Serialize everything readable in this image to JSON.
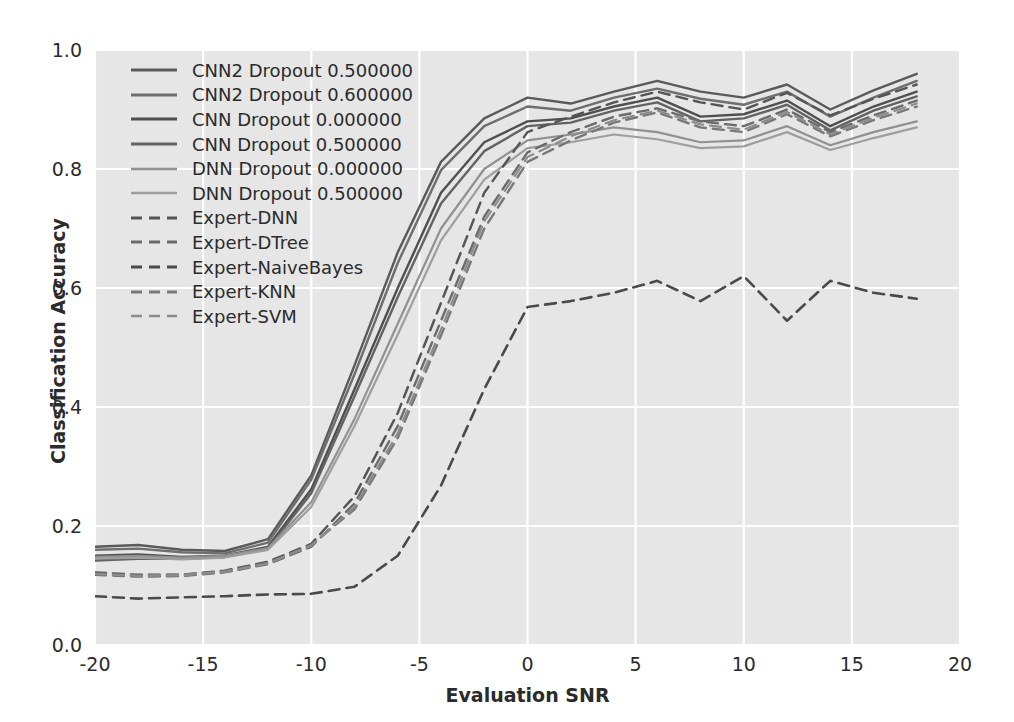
{
  "chart_data": {
    "type": "line",
    "title": "",
    "xlabel": "Evaluation SNR",
    "ylabel": "Classification Accuracy",
    "xlim": [
      -20,
      20
    ],
    "ylim": [
      0.0,
      1.0
    ],
    "xticks": [
      "-20",
      "-15",
      "-10",
      "-5",
      "0",
      "5",
      "10",
      "15",
      "20"
    ],
    "xtick_values": [
      -20,
      -15,
      -10,
      -5,
      0,
      5,
      10,
      15,
      20
    ],
    "yticks": [
      "0.0",
      "0.2",
      "0.4",
      "0.6",
      "0.8",
      "1.0"
    ],
    "ytick_values": [
      0.0,
      0.2,
      0.4,
      0.6,
      0.8,
      1.0
    ],
    "grid": true,
    "grid_color": "#ffffff",
    "axes_facecolor": "#e6e6e6",
    "legend_position": "upper left",
    "x": [
      -20,
      -18,
      -16,
      -14,
      -12,
      -10,
      -8,
      -6,
      -4,
      -2,
      0,
      2,
      4,
      6,
      8,
      10,
      12,
      14,
      16,
      18
    ],
    "series": [
      {
        "name": "CNN2 Dropout 0.500000",
        "color": "#5a5a5a",
        "linestyle": "solid",
        "linewidth": 2.4,
        "values": [
          0.165,
          0.168,
          0.16,
          0.158,
          0.178,
          0.285,
          0.47,
          0.66,
          0.812,
          0.885,
          0.92,
          0.91,
          0.93,
          0.948,
          0.93,
          0.92,
          0.942,
          0.9,
          0.932,
          0.96
        ]
      },
      {
        "name": "CNN2 Dropout 0.600000",
        "color": "#6e6e6e",
        "linestyle": "solid",
        "linewidth": 2.4,
        "values": [
          0.16,
          0.162,
          0.156,
          0.154,
          0.172,
          0.278,
          0.455,
          0.642,
          0.798,
          0.872,
          0.905,
          0.898,
          0.92,
          0.935,
          0.918,
          0.908,
          0.93,
          0.888,
          0.92,
          0.948
        ]
      },
      {
        "name": "CNN Dropout 0.000000",
        "color": "#4f4f4f",
        "linestyle": "solid",
        "linewidth": 2.4,
        "values": [
          0.15,
          0.152,
          0.148,
          0.15,
          0.165,
          0.262,
          0.43,
          0.6,
          0.76,
          0.845,
          0.88,
          0.885,
          0.905,
          0.92,
          0.888,
          0.892,
          0.915,
          0.872,
          0.905,
          0.93
        ]
      },
      {
        "name": "CNN Dropout 0.500000",
        "color": "#636363",
        "linestyle": "solid",
        "linewidth": 2.4,
        "values": [
          0.142,
          0.145,
          0.145,
          0.148,
          0.162,
          0.255,
          0.418,
          0.585,
          0.742,
          0.83,
          0.872,
          0.878,
          0.898,
          0.912,
          0.88,
          0.885,
          0.908,
          0.865,
          0.898,
          0.922
        ]
      },
      {
        "name": "DNN Dropout 0.000000",
        "color": "#919191",
        "linestyle": "solid",
        "linewidth": 2.2,
        "values": [
          0.148,
          0.15,
          0.147,
          0.15,
          0.163,
          0.24,
          0.38,
          0.54,
          0.7,
          0.8,
          0.848,
          0.858,
          0.87,
          0.862,
          0.845,
          0.848,
          0.872,
          0.84,
          0.862,
          0.88
        ]
      },
      {
        "name": "DNN Dropout 0.500000",
        "color": "#9e9e9e",
        "linestyle": "solid",
        "linewidth": 2.2,
        "values": [
          0.145,
          0.147,
          0.144,
          0.147,
          0.16,
          0.232,
          0.368,
          0.522,
          0.68,
          0.782,
          0.835,
          0.845,
          0.858,
          0.85,
          0.835,
          0.838,
          0.862,
          0.832,
          0.852,
          0.87
        ]
      },
      {
        "name": "Expert-DNN",
        "color": "#555555",
        "linestyle": "dashed",
        "linewidth": 2.4,
        "values": [
          0.122,
          0.118,
          0.118,
          0.125,
          0.14,
          0.17,
          0.25,
          0.39,
          0.575,
          0.76,
          0.862,
          0.888,
          0.912,
          0.93,
          0.912,
          0.9,
          0.928,
          0.89,
          0.918,
          0.942
        ]
      },
      {
        "name": "Expert-DTree",
        "color": "#6b6b6b",
        "linestyle": "dashed",
        "linewidth": 2.4,
        "values": [
          0.118,
          0.115,
          0.116,
          0.122,
          0.136,
          0.165,
          0.238,
          0.368,
          0.545,
          0.72,
          0.828,
          0.862,
          0.888,
          0.902,
          0.88,
          0.872,
          0.9,
          0.862,
          0.89,
          0.915
        ]
      },
      {
        "name": "Expert-NaiveBayes",
        "color": "#4a4a4a",
        "linestyle": "dashed",
        "linewidth": 2.6,
        "values": [
          0.082,
          0.078,
          0.08,
          0.082,
          0.085,
          0.086,
          0.098,
          0.15,
          0.268,
          0.43,
          0.568,
          0.578,
          0.592,
          0.612,
          0.578,
          0.62,
          0.545,
          0.612,
          0.592,
          0.582
        ]
      },
      {
        "name": "Expert-KNN",
        "color": "#787878",
        "linestyle": "dashed",
        "linewidth": 2.4,
        "values": [
          0.12,
          0.117,
          0.118,
          0.124,
          0.138,
          0.168,
          0.228,
          0.348,
          0.52,
          0.7,
          0.812,
          0.848,
          0.878,
          0.895,
          0.87,
          0.862,
          0.892,
          0.855,
          0.882,
          0.905
        ]
      },
      {
        "name": "Expert-SVM",
        "color": "#8c8c8c",
        "linestyle": "dashed",
        "linewidth": 2.2,
        "values": [
          0.119,
          0.116,
          0.117,
          0.123,
          0.137,
          0.167,
          0.232,
          0.356,
          0.53,
          0.712,
          0.82,
          0.855,
          0.882,
          0.898,
          0.875,
          0.866,
          0.896,
          0.858,
          0.886,
          0.91
        ]
      }
    ]
  }
}
